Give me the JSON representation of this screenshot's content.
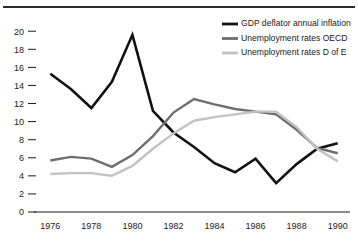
{
  "chart_data": {
    "type": "line",
    "title": "",
    "subtitle": "",
    "xlabel": "",
    "ylabel": "",
    "xlim": [
      1975.4,
      1990.6
    ],
    "ylim": [
      0,
      20.8
    ],
    "grid": false,
    "legend_position": "top-right",
    "x": [
      1976,
      1977,
      1978,
      1979,
      1980,
      1981,
      1982,
      1983,
      1984,
      1985,
      1986,
      1987,
      1988,
      1989,
      1990
    ],
    "xtick_labels": [
      "1976",
      "1978",
      "1980",
      "1982",
      "1984",
      "1986",
      "1988",
      "1990"
    ],
    "xtick_values": [
      1976,
      1978,
      1980,
      1982,
      1984,
      1986,
      1988,
      1990
    ],
    "ytick_labels": [
      "0",
      "2",
      "4",
      "6",
      "8",
      "10",
      "12",
      "14",
      "16",
      "18",
      "20"
    ],
    "ytick_values": [
      0,
      2,
      4,
      6,
      8,
      10,
      12,
      14,
      16,
      18,
      20
    ],
    "series": [
      {
        "name": "GDP deflator annual inflation",
        "color": "#111111",
        "width": 2.6,
        "values": [
          15.3,
          13.6,
          11.5,
          14.4,
          19.6,
          11.2,
          8.8,
          7.2,
          5.4,
          4.4,
          5.9,
          3.2,
          5.3,
          7.0,
          7.6
        ]
      },
      {
        "name": "Unemployment rates OECD",
        "color": "#6e6e6e",
        "width": 2.4,
        "values": [
          5.7,
          6.1,
          5.9,
          5.0,
          6.3,
          8.4,
          11.0,
          12.5,
          11.9,
          11.4,
          11.1,
          10.8,
          9.1,
          7.1,
          6.5
        ]
      },
      {
        "name": "Unemployment rates D of E",
        "color": "#c2c2c2",
        "width": 2.4,
        "values": [
          4.2,
          4.3,
          4.3,
          4.0,
          5.1,
          7.0,
          8.7,
          10.1,
          10.5,
          10.8,
          11.1,
          11.1,
          9.4,
          7.0,
          5.6
        ]
      }
    ]
  },
  "legend": {
    "items": [
      {
        "label": "GDP deflator annual inflation",
        "color": "#111111"
      },
      {
        "label": "Unemployment rates OECD",
        "color": "#6e6e6e"
      },
      {
        "label": "Unemployment rates D of E",
        "color": "#c2c2c2"
      }
    ]
  }
}
